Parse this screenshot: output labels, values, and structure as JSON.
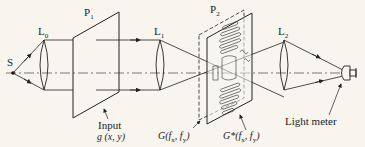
{
  "diagram": {
    "type": "optical-correlator-setup",
    "colors": {
      "background": "#f7f5ee",
      "line": "#222222",
      "axis": "#444444"
    },
    "components": [
      {
        "id": "source",
        "label": "S"
      },
      {
        "id": "lens-0",
        "label": "L",
        "sub": "0"
      },
      {
        "id": "plane-1",
        "label": "P",
        "sub": "1"
      },
      {
        "id": "lens-1",
        "label": "L",
        "sub": "1"
      },
      {
        "id": "plane-2",
        "label": "P",
        "sub": "2"
      },
      {
        "id": "lens-2",
        "label": "L",
        "sub": "2"
      },
      {
        "id": "light-meter",
        "label": "Light meter"
      }
    ],
    "labels": {
      "source": "S",
      "l0": "L",
      "l0_sub": "0",
      "p1": "P",
      "p1_sub": "1",
      "l1": "L",
      "l1_sub": "1",
      "p2": "P",
      "p2_sub": "2",
      "l2": "L",
      "l2_sub": "2",
      "input_title": "Input",
      "input_func": "g (x, y)",
      "g_func": "G(f",
      "g_sub_x": "x",
      "g_mid": ", f",
      "g_sub_y": "y",
      "g_end": ")",
      "gstar_func": "G*(f",
      "gstar_sub_x": "x",
      "gstar_mid": ", f",
      "gstar_sub_y": "y",
      "gstar_end": ")",
      "light_meter": "Light meter"
    }
  }
}
